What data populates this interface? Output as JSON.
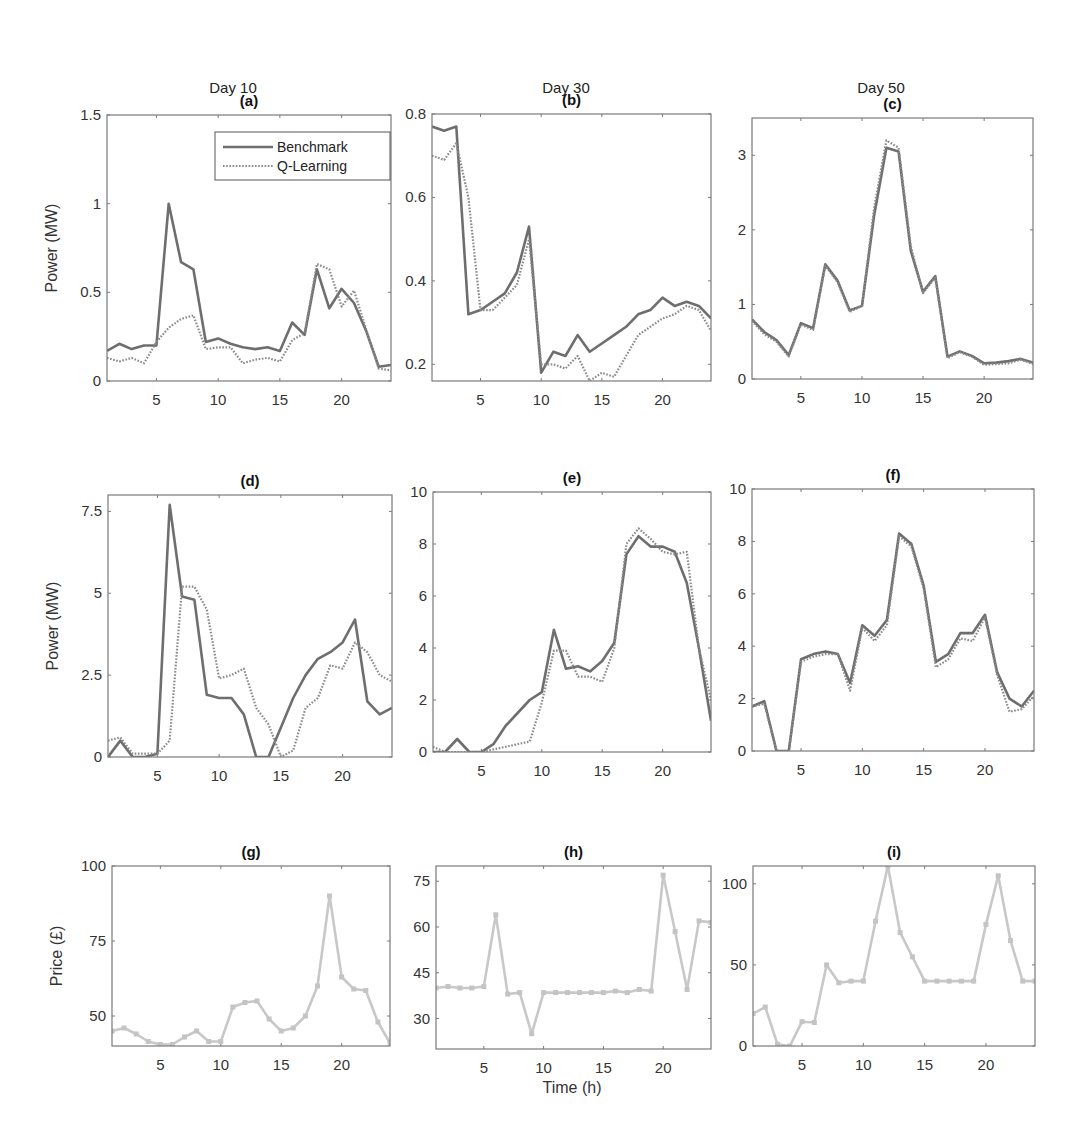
{
  "figure": {
    "top_cropped_caption": "",
    "column_titles": [
      "Day 10",
      "Day 30",
      "Day 50"
    ],
    "xlabel": "Time (h)",
    "ylabel_power": "Power (MW)",
    "ylabel_price": "Price (£)",
    "legend": [
      "Benchmark",
      "Q-Learning"
    ],
    "colors": {
      "benchmark": "#6e6e6e",
      "qlearning": "#8a8a8a",
      "price": "#c8c8c8",
      "axes": "#7a7a7a"
    }
  },
  "chart_data": [
    {
      "id": "a",
      "title": "(a)",
      "type": "line",
      "box": [
        107,
        115,
        391,
        381
      ],
      "xlim": [
        1,
        24
      ],
      "ylim": [
        0,
        1.5
      ],
      "xticks": [
        5,
        10,
        15,
        20
      ],
      "yticks": [
        0,
        0.5,
        1,
        1.5
      ],
      "ytick_labels": [
        "0",
        "0.5",
        "1",
        "1.5"
      ],
      "ylabel": "Power (MW)",
      "legend": true,
      "x": [
        1,
        2,
        3,
        4,
        5,
        6,
        7,
        8,
        9,
        10,
        11,
        12,
        13,
        14,
        15,
        16,
        17,
        18,
        19,
        20,
        21,
        22,
        23,
        24
      ],
      "series": [
        {
          "name": "Benchmark",
          "values": [
            0.17,
            0.21,
            0.18,
            0.2,
            0.2,
            1.0,
            0.67,
            0.63,
            0.22,
            0.24,
            0.21,
            0.19,
            0.18,
            0.19,
            0.17,
            0.33,
            0.26,
            0.63,
            0.41,
            0.52,
            0.44,
            0.28,
            0.08,
            0.09
          ]
        },
        {
          "name": "Q-Learning",
          "values": [
            0.13,
            0.11,
            0.13,
            0.1,
            0.22,
            0.3,
            0.35,
            0.37,
            0.18,
            0.19,
            0.19,
            0.1,
            0.12,
            0.13,
            0.11,
            0.23,
            0.27,
            0.66,
            0.63,
            0.42,
            0.51,
            0.29,
            0.07,
            0.06
          ]
        }
      ]
    },
    {
      "id": "b",
      "title": "(b)",
      "type": "line",
      "box": [
        432,
        114,
        711,
        381
      ],
      "xlim": [
        1,
        24
      ],
      "ylim": [
        0.16,
        0.8
      ],
      "xticks": [
        5,
        10,
        15,
        20
      ],
      "yticks": [
        0.2,
        0.4,
        0.6,
        0.8
      ],
      "ytick_labels": [
        "0.2",
        "0.4",
        "0.6",
        "0.8"
      ],
      "ylabel": "",
      "legend": false,
      "x": [
        1,
        2,
        3,
        4,
        5,
        6,
        7,
        8,
        9,
        10,
        11,
        12,
        13,
        14,
        15,
        16,
        17,
        18,
        19,
        20,
        21,
        22,
        23,
        24
      ],
      "series": [
        {
          "name": "Benchmark",
          "values": [
            0.77,
            0.76,
            0.77,
            0.32,
            0.33,
            0.35,
            0.37,
            0.42,
            0.53,
            0.18,
            0.23,
            0.22,
            0.27,
            0.23,
            0.25,
            0.27,
            0.29,
            0.32,
            0.33,
            0.36,
            0.34,
            0.35,
            0.34,
            0.31
          ]
        },
        {
          "name": "Q-Learning",
          "values": [
            0.7,
            0.69,
            0.73,
            0.6,
            0.33,
            0.33,
            0.36,
            0.39,
            0.5,
            0.2,
            0.2,
            0.19,
            0.22,
            0.16,
            0.18,
            0.17,
            0.22,
            0.27,
            0.29,
            0.31,
            0.32,
            0.34,
            0.33,
            0.28
          ]
        }
      ]
    },
    {
      "id": "c",
      "title": "(c)",
      "type": "line",
      "box": [
        752,
        118,
        1033,
        379
      ],
      "xlim": [
        1,
        24
      ],
      "ylim": [
        0,
        3.5
      ],
      "xticks": [
        5,
        10,
        15,
        20
      ],
      "yticks": [
        0,
        1,
        2,
        3
      ],
      "ytick_labels": [
        "0",
        "1",
        "2",
        "3"
      ],
      "ylabel": "",
      "legend": false,
      "x": [
        1,
        2,
        3,
        4,
        5,
        6,
        7,
        8,
        9,
        10,
        11,
        12,
        13,
        14,
        15,
        16,
        17,
        18,
        19,
        20,
        21,
        22,
        23,
        24
      ],
      "series": [
        {
          "name": "Benchmark",
          "values": [
            0.8,
            0.63,
            0.52,
            0.32,
            0.75,
            0.68,
            1.54,
            1.32,
            0.92,
            0.98,
            2.2,
            3.1,
            3.05,
            1.72,
            1.17,
            1.38,
            0.3,
            0.37,
            0.31,
            0.21,
            0.22,
            0.24,
            0.27,
            0.22
          ]
        },
        {
          "name": "Q-Learning",
          "values": [
            0.78,
            0.6,
            0.5,
            0.3,
            0.73,
            0.66,
            1.52,
            1.3,
            0.9,
            0.98,
            2.3,
            3.2,
            3.1,
            1.78,
            1.15,
            1.36,
            0.28,
            0.36,
            0.3,
            0.19,
            0.2,
            0.21,
            0.26,
            0.2
          ]
        }
      ]
    },
    {
      "id": "d",
      "title": "(d)",
      "type": "line",
      "box": [
        108,
        495,
        392,
        757
      ],
      "xlim": [
        1,
        24
      ],
      "ylim": [
        0,
        8.0
      ],
      "xticks": [
        5,
        10,
        15,
        20
      ],
      "yticks": [
        0,
        2.5,
        5,
        7.5
      ],
      "ytick_labels": [
        "0",
        "2.5",
        "5",
        "7.5"
      ],
      "ylabel": "Power (MW)",
      "legend": false,
      "x": [
        1,
        2,
        3,
        4,
        5,
        6,
        7,
        8,
        9,
        10,
        11,
        12,
        13,
        14,
        15,
        16,
        17,
        18,
        19,
        20,
        21,
        22,
        23,
        24
      ],
      "series": [
        {
          "name": "Benchmark",
          "values": [
            0.0,
            0.5,
            0.0,
            0.0,
            0.1,
            7.7,
            4.9,
            4.8,
            1.9,
            1.8,
            1.8,
            1.3,
            0.0,
            0.0,
            0.9,
            1.8,
            2.5,
            3.0,
            3.2,
            3.5,
            4.2,
            1.7,
            1.3,
            1.5
          ]
        },
        {
          "name": "Q-Learning",
          "values": [
            0.5,
            0.6,
            0.1,
            0.1,
            0.1,
            0.5,
            5.2,
            5.2,
            4.5,
            2.4,
            2.5,
            2.7,
            1.5,
            1.0,
            0.0,
            0.2,
            1.5,
            1.8,
            2.8,
            2.7,
            3.5,
            3.2,
            2.5,
            2.3
          ]
        }
      ]
    },
    {
      "id": "e",
      "title": "(e)",
      "type": "line",
      "box": [
        433,
        492,
        711,
        752
      ],
      "xlim": [
        1,
        24
      ],
      "ylim": [
        0,
        10
      ],
      "xticks": [
        5,
        10,
        15,
        20
      ],
      "yticks": [
        0,
        2,
        4,
        6,
        8,
        10
      ],
      "ytick_labels": [
        "0",
        "2",
        "4",
        "6",
        "8",
        "10"
      ],
      "ylabel": "",
      "legend": false,
      "x": [
        1,
        2,
        3,
        4,
        5,
        6,
        7,
        8,
        9,
        10,
        11,
        12,
        13,
        14,
        15,
        16,
        17,
        18,
        19,
        20,
        21,
        22,
        23,
        24
      ],
      "series": [
        {
          "name": "Benchmark",
          "values": [
            0.0,
            0.0,
            0.5,
            0.0,
            0.0,
            0.3,
            1.0,
            1.5,
            2.0,
            2.3,
            4.7,
            3.2,
            3.3,
            3.1,
            3.5,
            4.2,
            7.6,
            8.3,
            7.9,
            7.9,
            7.7,
            6.5,
            4.0,
            1.2
          ]
        },
        {
          "name": "Q-Learning",
          "values": [
            0.2,
            0.0,
            0.0,
            0.0,
            0.0,
            0.1,
            0.2,
            0.3,
            0.4,
            1.9,
            3.9,
            3.9,
            2.9,
            2.9,
            2.7,
            4.0,
            8.0,
            8.6,
            8.2,
            7.7,
            7.6,
            7.7,
            4.0,
            2.0
          ]
        }
      ]
    },
    {
      "id": "f",
      "title": "(f)",
      "type": "line",
      "box": [
        752,
        489,
        1034,
        751
      ],
      "xlim": [
        1,
        24
      ],
      "ylim": [
        0,
        10
      ],
      "xticks": [
        5,
        10,
        15,
        20
      ],
      "yticks": [
        0,
        2,
        4,
        6,
        8,
        10
      ],
      "ytick_labels": [
        "0",
        "2",
        "4",
        "6",
        "8",
        "10"
      ],
      "ylabel": "",
      "legend": false,
      "x": [
        1,
        2,
        3,
        4,
        5,
        6,
        7,
        8,
        9,
        10,
        11,
        12,
        13,
        14,
        15,
        16,
        17,
        18,
        19,
        20,
        21,
        22,
        23,
        24
      ],
      "series": [
        {
          "name": "Benchmark",
          "values": [
            1.7,
            1.9,
            0.0,
            0.0,
            3.5,
            3.7,
            3.8,
            3.7,
            2.6,
            4.8,
            4.4,
            5.0,
            8.3,
            7.9,
            6.3,
            3.4,
            3.7,
            4.5,
            4.5,
            5.2,
            3.0,
            2.0,
            1.7,
            2.3
          ]
        },
        {
          "name": "Q-Learning",
          "values": [
            1.7,
            1.8,
            0.0,
            0.0,
            3.4,
            3.6,
            3.7,
            3.7,
            2.3,
            4.7,
            4.2,
            4.8,
            8.2,
            7.8,
            6.2,
            3.2,
            3.5,
            4.3,
            4.2,
            5.1,
            2.9,
            1.5,
            1.6,
            2.1
          ]
        }
      ]
    },
    {
      "id": "g",
      "title": "(g)",
      "type": "line",
      "box": [
        112,
        866,
        390,
        1046
      ],
      "xlim": [
        1,
        24
      ],
      "ylim": [
        40,
        100
      ],
      "xticks": [
        5,
        10,
        15,
        20
      ],
      "yticks": [
        50,
        75,
        100
      ],
      "ytick_labels": [
        "50",
        "75",
        "100"
      ],
      "ylabel": "Price (£)",
      "legend": false,
      "markers": true,
      "x": [
        1,
        2,
        3,
        4,
        5,
        6,
        7,
        8,
        9,
        10,
        11,
        12,
        13,
        14,
        15,
        16,
        17,
        18,
        19,
        20,
        21,
        22,
        23,
        24
      ],
      "series": [
        {
          "name": "Price",
          "values": [
            45,
            46,
            44,
            41.5,
            40.5,
            40.5,
            43,
            45,
            41.5,
            41.5,
            53,
            54.5,
            55,
            49,
            45,
            46,
            50,
            60,
            90,
            63,
            59,
            58.5,
            48,
            41
          ]
        }
      ]
    },
    {
      "id": "h",
      "title": "(h)",
      "type": "line",
      "box": [
        436,
        866,
        711,
        1049
      ],
      "xlim": [
        1,
        24
      ],
      "ylim": [
        20,
        80
      ],
      "xticks": [
        5,
        10,
        15,
        20
      ],
      "yticks": [
        30,
        45,
        60,
        75
      ],
      "ytick_labels": [
        "30",
        "45",
        "60",
        "75"
      ],
      "ylabel": "",
      "xlabel": "Time (h)",
      "legend": false,
      "markers": true,
      "x": [
        1,
        2,
        3,
        4,
        5,
        6,
        7,
        8,
        9,
        10,
        11,
        12,
        13,
        14,
        15,
        16,
        17,
        18,
        19,
        20,
        21,
        22,
        23,
        24
      ],
      "series": [
        {
          "name": "Price",
          "values": [
            40,
            40.5,
            40,
            40,
            40.5,
            64,
            38,
            38.5,
            25,
            38.5,
            38.5,
            38.5,
            38.5,
            38.5,
            38.5,
            39,
            38.5,
            39.5,
            39,
            77,
            58.5,
            39.5,
            62,
            61.5
          ]
        }
      ]
    },
    {
      "id": "i",
      "title": "(i)",
      "type": "line",
      "box": [
        753,
        866,
        1035,
        1046
      ],
      "xlim": [
        1,
        24
      ],
      "ylim": [
        0,
        111
      ],
      "xticks": [
        5,
        10,
        15,
        20
      ],
      "yticks": [
        0,
        50,
        100
      ],
      "ytick_labels": [
        "0",
        "50",
        "100"
      ],
      "ylabel": "",
      "legend": false,
      "markers": true,
      "x": [
        1,
        2,
        3,
        4,
        5,
        6,
        7,
        8,
        9,
        10,
        11,
        12,
        13,
        14,
        15,
        16,
        17,
        18,
        19,
        20,
        21,
        22,
        23,
        24
      ],
      "series": [
        {
          "name": "Price",
          "values": [
            20,
            24,
            1,
            0,
            15,
            14.5,
            50,
            39,
            40,
            40,
            77,
            111,
            70,
            55,
            40,
            40,
            40,
            40,
            40,
            75,
            105,
            65,
            40,
            40
          ]
        }
      ]
    }
  ]
}
